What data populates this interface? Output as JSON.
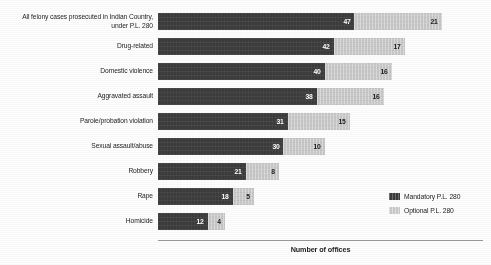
{
  "chart_data": {
    "type": "bar",
    "orientation": "horizontal",
    "stacked": true,
    "title": "",
    "xlabel": "Number of offices",
    "ylabel": "",
    "grid": false,
    "legend_position": "bottom-right",
    "xlim": [
      0,
      78
    ],
    "categories": [
      "All felony cases prosecuted in Indian Country,\nunder P.L. 280",
      "Drug-related",
      "Domestic violence",
      "Aggravated assault",
      "Parole/probation violation",
      "Sexual assault/abuse",
      "Robbery",
      "Rape",
      "Homicide"
    ],
    "series": [
      {
        "name": "Mandatory P.L. 280",
        "color": "#3b3b3b",
        "values": [
          47,
          42,
          40,
          38,
          31,
          30,
          21,
          18,
          12
        ]
      },
      {
        "name": "Optional P.L. 280",
        "color": "#c8c8c8",
        "values": [
          21,
          17,
          16,
          16,
          15,
          10,
          8,
          5,
          4
        ]
      }
    ]
  },
  "axis": {
    "title": "Number of offices"
  },
  "legend": {
    "items": [
      {
        "label": "Mandatory P.L. 280",
        "swatch": "mandatory"
      },
      {
        "label": "Optional P.L. 280",
        "swatch": "optional"
      }
    ]
  }
}
